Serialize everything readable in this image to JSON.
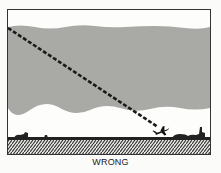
{
  "figure": {
    "caption": "WRONG",
    "colors": {
      "background": "#fbfbf9",
      "frame": "#333333",
      "cloud_band": "#a9a9a6",
      "line": "#1a1a1a",
      "ground": "#222222"
    },
    "elements": {
      "cloud_layer": "gray cloud band",
      "approach_path": "dashed diagonal line",
      "aircraft": "airplane icon",
      "ground": "hatched terrain"
    }
  }
}
